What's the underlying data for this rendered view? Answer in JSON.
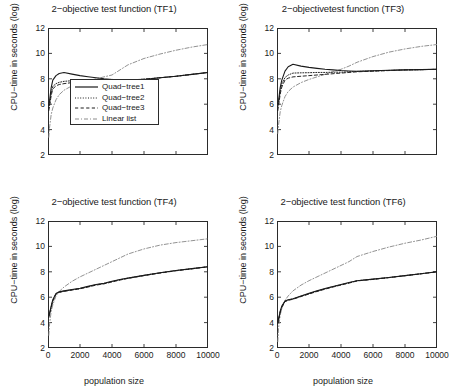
{
  "figure": {
    "name": "quad-tree-cpu-time-figure",
    "panel_order": [
      "tf1",
      "tf3",
      "tf4",
      "tf6"
    ]
  },
  "axes": {
    "ylabel": "CPU−time in seconds (log)",
    "xlabel": "population size",
    "yticks": [
      "2",
      "4",
      "6",
      "8",
      "10",
      "12"
    ],
    "xticks": [
      "0",
      "2000",
      "4000",
      "6000",
      "8000",
      "10000"
    ],
    "ylim": [
      2,
      12
    ],
    "xlim": [
      0,
      10000
    ]
  },
  "legend": {
    "visible_in": "tf1",
    "entries": [
      {
        "label": "Quad−tree1",
        "style": "solid",
        "color": "#1a1a1a"
      },
      {
        "label": "Quad−tree2",
        "style": "dotted",
        "color": "#1a1a1a"
      },
      {
        "label": "Quad−tree3",
        "style": "dashed",
        "color": "#1a1a1a"
      },
      {
        "label": "Linear list",
        "style": "dashdot",
        "color": "#8c8c8c"
      }
    ]
  },
  "colors": {
    "axis": "#2b2b2b",
    "ink": "#1a1a1a",
    "linear_list": "#8c8c8c",
    "background": "#ffffff"
  },
  "chart_data": [
    {
      "id": "tf1",
      "type": "line",
      "title": "2−objective test function (TF1)",
      "xlabel": "population size",
      "ylabel": "CPU−time in seconds (log)",
      "xlim": [
        0,
        10000
      ],
      "ylim": [
        2,
        12
      ],
      "grid": false,
      "legend_position": "lower right",
      "x": [
        50,
        100,
        200,
        300,
        500,
        700,
        1000,
        1500,
        2000,
        2500,
        3000,
        3500,
        4000,
        4500,
        5000,
        6000,
        7000,
        8000,
        9000,
        10000
      ],
      "series": [
        {
          "name": "Quad−tree1",
          "style": "solid",
          "values": [
            5.9,
            6.3,
            7.3,
            7.9,
            8.25,
            8.42,
            8.5,
            8.37,
            8.25,
            8.16,
            8.08,
            8.0,
            7.95,
            7.9,
            7.88,
            7.95,
            8.08,
            8.2,
            8.35,
            8.5
          ]
        },
        {
          "name": "Quad−tree2",
          "style": "dotted",
          "values": [
            5.7,
            6.0,
            6.9,
            7.4,
            7.62,
            7.72,
            7.8,
            7.85,
            7.88,
            7.9,
            7.92,
            7.94,
            7.95,
            7.92,
            7.9,
            7.97,
            8.08,
            8.2,
            8.35,
            8.5
          ]
        },
        {
          "name": "Quad−tree3",
          "style": "dashed",
          "values": [
            5.5,
            5.85,
            6.7,
            7.2,
            7.45,
            7.55,
            7.62,
            7.7,
            7.78,
            7.83,
            7.88,
            7.92,
            7.95,
            7.92,
            7.9,
            7.97,
            8.08,
            8.2,
            8.35,
            8.5
          ]
        },
        {
          "name": "Linear list",
          "style": "dashdot",
          "values": [
            3.4,
            4.2,
            5.2,
            5.7,
            6.35,
            6.75,
            7.1,
            7.45,
            7.65,
            7.85,
            8.0,
            8.15,
            8.3,
            8.7,
            9.1,
            9.6,
            9.95,
            10.25,
            10.5,
            10.7
          ]
        }
      ]
    },
    {
      "id": "tf3",
      "type": "line",
      "title": "2−objectivetest function (TF3)",
      "xlabel": "population size",
      "ylabel": "CPU−time in seconds (log)",
      "xlim": [
        0,
        10000
      ],
      "ylim": [
        2,
        12
      ],
      "grid": false,
      "legend_position": "none",
      "x": [
        50,
        100,
        200,
        300,
        500,
        700,
        1000,
        1500,
        2000,
        2500,
        3000,
        3500,
        4000,
        4500,
        5000,
        6000,
        7000,
        8000,
        9000,
        10000
      ],
      "series": [
        {
          "name": "Quad−tree1",
          "style": "solid",
          "values": [
            6.0,
            6.3,
            7.3,
            7.9,
            8.6,
            8.95,
            9.15,
            9.0,
            8.9,
            8.82,
            8.75,
            8.7,
            8.65,
            8.62,
            8.6,
            8.63,
            8.67,
            8.7,
            8.72,
            8.75
          ]
        },
        {
          "name": "Quad−tree2",
          "style": "dotted",
          "values": [
            5.8,
            6.1,
            7.0,
            7.6,
            8.1,
            8.3,
            8.45,
            8.47,
            8.48,
            8.5,
            8.5,
            8.52,
            8.52,
            8.55,
            8.58,
            8.62,
            8.66,
            8.7,
            8.72,
            8.75
          ]
        },
        {
          "name": "Quad−tree3",
          "style": "dashed",
          "values": [
            5.5,
            5.9,
            6.8,
            7.35,
            7.9,
            8.05,
            8.15,
            8.2,
            8.25,
            8.3,
            8.35,
            8.4,
            8.45,
            8.5,
            8.55,
            8.6,
            8.65,
            8.7,
            8.72,
            8.75
          ]
        },
        {
          "name": "Linear list",
          "style": "dashdot",
          "values": [
            3.7,
            4.4,
            5.4,
            5.9,
            6.6,
            7.0,
            7.35,
            7.7,
            7.95,
            8.15,
            8.35,
            8.55,
            8.75,
            9.0,
            9.3,
            9.75,
            10.1,
            10.35,
            10.55,
            10.7
          ]
        }
      ]
    },
    {
      "id": "tf4",
      "type": "line",
      "title": "2−objective test function (TF4)",
      "xlabel": "population size",
      "ylabel": "CPU−time in seconds (log)",
      "xlim": [
        0,
        10000
      ],
      "ylim": [
        2,
        12
      ],
      "grid": false,
      "legend_position": "none",
      "x": [
        50,
        100,
        200,
        300,
        500,
        700,
        1000,
        1500,
        2000,
        2500,
        3000,
        3500,
        4000,
        4500,
        5000,
        6000,
        7000,
        8000,
        9000,
        10000
      ],
      "series": [
        {
          "name": "Quad−tree1",
          "style": "solid",
          "values": [
            4.6,
            4.75,
            5.3,
            5.8,
            6.3,
            6.42,
            6.5,
            6.6,
            6.7,
            6.85,
            7.0,
            7.1,
            7.25,
            7.4,
            7.5,
            7.72,
            7.92,
            8.1,
            8.25,
            8.4
          ]
        },
        {
          "name": "Quad−tree2",
          "style": "dotted",
          "values": [
            4.5,
            4.7,
            5.25,
            5.75,
            6.28,
            6.4,
            6.48,
            6.58,
            6.68,
            6.83,
            6.98,
            7.08,
            7.23,
            7.38,
            7.5,
            7.72,
            7.92,
            8.1,
            8.25,
            8.4
          ]
        },
        {
          "name": "Quad−tree3",
          "style": "dashed",
          "values": [
            4.4,
            4.65,
            5.2,
            5.7,
            6.25,
            6.38,
            6.46,
            6.56,
            6.66,
            6.8,
            6.95,
            7.05,
            7.2,
            7.35,
            7.48,
            7.7,
            7.9,
            8.08,
            8.23,
            8.4
          ]
        },
        {
          "name": "Linear list",
          "style": "dashdot",
          "values": [
            3.0,
            3.9,
            4.9,
            5.4,
            6.1,
            6.45,
            6.8,
            7.25,
            7.6,
            7.9,
            8.2,
            8.5,
            8.8,
            9.1,
            9.4,
            9.8,
            10.1,
            10.3,
            10.45,
            10.6
          ]
        }
      ]
    },
    {
      "id": "tf6",
      "type": "line",
      "title": "2−objective test function (TF6)",
      "xlabel": "population size",
      "ylabel": "CPU−time in seconds (log)",
      "xlim": [
        0,
        10000
      ],
      "ylim": [
        2,
        12
      ],
      "grid": false,
      "legend_position": "none",
      "x": [
        50,
        100,
        200,
        300,
        500,
        700,
        1000,
        1500,
        2000,
        2500,
        3000,
        3500,
        4000,
        4500,
        5000,
        6000,
        7000,
        8000,
        9000,
        10000
      ],
      "series": [
        {
          "name": "Quad−tree1",
          "style": "solid",
          "values": [
            4.1,
            4.3,
            4.9,
            5.3,
            5.7,
            5.8,
            5.88,
            6.1,
            6.3,
            6.5,
            6.68,
            6.85,
            7.0,
            7.15,
            7.3,
            7.42,
            7.55,
            7.7,
            7.85,
            8.0
          ]
        },
        {
          "name": "Quad−tree2",
          "style": "dotted",
          "values": [
            4.0,
            4.25,
            4.85,
            5.25,
            5.68,
            5.78,
            5.86,
            6.08,
            6.28,
            6.48,
            6.66,
            6.83,
            6.98,
            7.13,
            7.3,
            7.42,
            7.55,
            7.7,
            7.85,
            8.0
          ]
        },
        {
          "name": "Quad−tree3",
          "style": "dashed",
          "values": [
            3.9,
            4.2,
            4.8,
            5.2,
            5.65,
            5.75,
            5.84,
            6.05,
            6.25,
            6.45,
            6.63,
            6.8,
            6.96,
            7.11,
            7.28,
            7.4,
            7.54,
            7.69,
            7.84,
            8.0
          ]
        },
        {
          "name": "Linear list",
          "style": "dashdot",
          "values": [
            2.5,
            3.6,
            4.6,
            5.1,
            5.75,
            6.1,
            6.5,
            6.95,
            7.3,
            7.6,
            7.9,
            8.2,
            8.5,
            8.8,
            9.2,
            9.6,
            9.95,
            10.25,
            10.5,
            10.8
          ]
        }
      ]
    }
  ]
}
